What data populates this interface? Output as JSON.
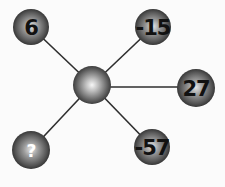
{
  "puzzle": {
    "type": "number-star-diagram",
    "center": {
      "label": ""
    },
    "nodes": [
      {
        "id": "top-left",
        "label": "6",
        "is_unknown": false
      },
      {
        "id": "top-right",
        "label": "-15",
        "is_unknown": false
      },
      {
        "id": "right",
        "label": "27",
        "is_unknown": false
      },
      {
        "id": "bottom-left",
        "label": "?",
        "is_unknown": true
      },
      {
        "id": "bottom-right",
        "label": "-57",
        "is_unknown": false
      }
    ]
  },
  "colors": {
    "sphere_dark": "#2a2a2a",
    "sphere_mid": "#7a7a7a",
    "sphere_highlight": "#f2f2f2",
    "edge": "#2e2e2e",
    "label": "#111111",
    "unknown_label": "#ffffff"
  }
}
